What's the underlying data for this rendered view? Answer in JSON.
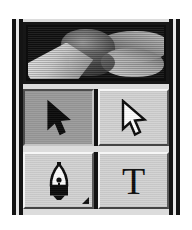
{
  "palette": {
    "name": "Toolbox Palette",
    "background_color": "#c9c9c9",
    "frame_color": "#141414"
  },
  "preview": {
    "name": "image-preview",
    "caption": "",
    "background_color": "#0d0d0d",
    "description": "grayscale photographic thumbnail"
  },
  "tools": {
    "rows": [
      {
        "items": [
          {
            "id": "selection-tool",
            "label": "Selection",
            "icon": "arrow-cursor-filled-icon",
            "state": "selected",
            "has_flyout": false
          },
          {
            "id": "direct-selection-tool",
            "label": "Direct Selection",
            "icon": "arrow-cursor-hollow-icon",
            "state": "normal",
            "has_flyout": false
          }
        ]
      },
      {
        "items": [
          {
            "id": "pen-tool",
            "label": "Pen",
            "icon": "pen-nib-icon",
            "state": "normal",
            "has_flyout": true
          },
          {
            "id": "type-tool",
            "label": "Type",
            "icon": "type-T-icon",
            "state": "normal",
            "has_flyout": false,
            "glyph": "T"
          }
        ]
      }
    ]
  },
  "colors": {
    "button_face": "#d2d2d2",
    "button_selected": "#9a9a9a",
    "bevel_light": "#f6f6f6",
    "bevel_dark": "#444444",
    "ink": "#0c0c0c"
  }
}
